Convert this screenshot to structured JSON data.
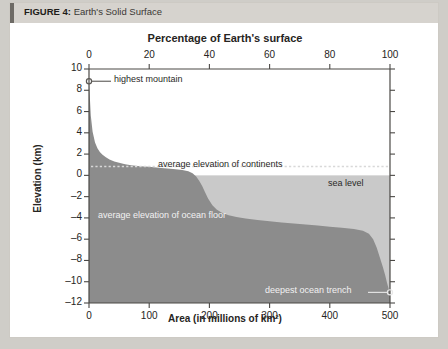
{
  "figure": {
    "label": "FIGURE 4:",
    "title": "Earth's Solid Surface"
  },
  "chart_data": {
    "type": "area",
    "title": "Earth's Solid Surface",
    "xlabel": "Area (in millions of km²)",
    "ylabel": "Elevation (km)",
    "top_axis_label": "Percentage of Earth's surface",
    "xlim": [
      0,
      500
    ],
    "ylim": [
      -12,
      10
    ],
    "xticks": [
      0,
      100,
      200,
      300,
      400,
      500
    ],
    "xtick_labels": [
      "0",
      "100",
      "200",
      "300",
      "400",
      "500"
    ],
    "top_xticks": [
      0,
      20,
      40,
      60,
      80,
      100
    ],
    "top_xtick_labels": [
      "0",
      "20",
      "40",
      "60",
      "80",
      "100"
    ],
    "yticks": [
      10,
      8,
      6,
      4,
      2,
      0,
      -2,
      -4,
      -6,
      -8,
      -10,
      -12
    ],
    "ytick_labels": [
      "10",
      "8",
      "6",
      "4",
      "2",
      "0",
      "–2",
      "–4",
      "–6",
      "–8",
      "–10",
      "–12"
    ],
    "grid": false,
    "legend": "none",
    "series": [
      {
        "name": "hypsometric curve",
        "x": [
          0,
          3,
          6,
          10,
          14,
          18,
          22,
          28,
          34,
          42,
          50,
          60,
          70,
          85,
          100,
          120,
          140,
          155,
          165,
          172,
          178,
          183,
          188,
          193,
          198,
          205,
          212,
          220,
          232,
          245,
          260,
          280,
          300,
          320,
          340,
          360,
          380,
          400,
          420,
          440,
          455,
          465,
          472,
          478,
          483,
          488,
          492,
          495,
          498,
          500
        ],
        "y": [
          8.85,
          5.6,
          4.1,
          3.1,
          2.55,
          2.2,
          1.95,
          1.7,
          1.5,
          1.3,
          1.18,
          1.05,
          0.96,
          0.86,
          0.8,
          0.7,
          0.6,
          0.5,
          0.38,
          0.2,
          -0.1,
          -0.5,
          -1.0,
          -1.6,
          -2.2,
          -2.8,
          -3.2,
          -3.5,
          -3.75,
          -3.92,
          -4.05,
          -4.2,
          -4.32,
          -4.42,
          -4.52,
          -4.62,
          -4.72,
          -4.82,
          -4.92,
          -5.05,
          -5.2,
          -5.5,
          -6.0,
          -6.8,
          -7.7,
          -8.6,
          -9.4,
          -10.1,
          -10.7,
          -11.0
        ]
      }
    ],
    "reference_lines": [
      {
        "name": "average elevation of continents",
        "value": 0.84,
        "style": "dotted"
      }
    ],
    "annotations": [
      {
        "name": "highest mountain",
        "text": "highest mountain",
        "x": 0,
        "y": 8.85,
        "marker": "circle"
      },
      {
        "name": "average elevation of continents",
        "text": "average elevation of continents",
        "y": 0.84
      },
      {
        "name": "sea level",
        "text": "sea level",
        "y": 0
      },
      {
        "name": "average elevation of ocean floor",
        "text": "average elevation of ocean floor",
        "y": -3.8
      },
      {
        "name": "deepest ocean trench",
        "text": "deepest ocean trench",
        "x": 500,
        "y": -11.0,
        "marker": "circle"
      }
    ],
    "colors": {
      "land_fill": "#8c8c8c",
      "ocean_fill": "#c9c9c9",
      "axis": "#4a4845",
      "plot_background": "#ffffff",
      "header_bar": "#d6d3ce",
      "page_background": "#cfcdc8"
    }
  }
}
